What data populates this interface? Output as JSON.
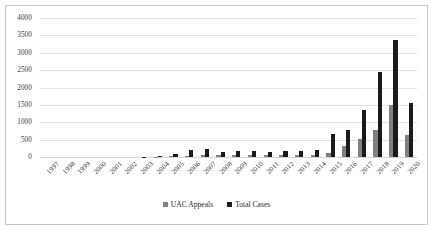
{
  "chart_data": {
    "type": "bar",
    "title": "",
    "xlabel": "",
    "ylabel": "",
    "ylim": [
      0,
      4000
    ],
    "ytick_step": 500,
    "yticks": [
      "4000",
      "3500",
      "3000",
      "2500",
      "2000",
      "1500",
      "1000",
      "500",
      "0"
    ],
    "grid": true,
    "legend_position": "bottom-center",
    "categories": [
      "1997",
      "1998",
      "1999",
      "2000",
      "2001",
      "2002",
      "2003",
      "2004",
      "2005",
      "2006",
      "2007",
      "2008",
      "2009",
      "2010",
      "2011",
      "2012",
      "2013",
      "2014",
      "2015",
      "2016",
      "2017",
      "2018",
      "2019",
      "2020"
    ],
    "series": [
      {
        "name": "UAC Appeals",
        "color": "#808080",
        "values": [
          0,
          0,
          0,
          0,
          0,
          0,
          0,
          5,
          15,
          40,
          60,
          45,
          55,
          50,
          45,
          55,
          50,
          60,
          110,
          330,
          520,
          790,
          1500,
          640
        ]
      },
      {
        "name": "Total Cases",
        "color": "#1a1a1a",
        "values": [
          0,
          0,
          0,
          0,
          0,
          0,
          5,
          25,
          95,
          190,
          230,
          150,
          175,
          165,
          150,
          180,
          160,
          195,
          650,
          790,
          1340,
          2450,
          3380,
          1560
        ]
      }
    ]
  },
  "legend": {
    "entries": [
      {
        "label": "UAC Appeals",
        "swatch": "uac"
      },
      {
        "label": "Total Cases",
        "swatch": "total"
      }
    ]
  }
}
